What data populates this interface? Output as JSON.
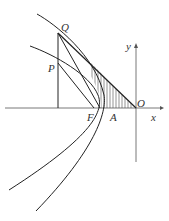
{
  "diagram": {
    "type": "geometry-figure",
    "labels": {
      "Q": "Q",
      "P": "P",
      "F": "F",
      "A": "A",
      "O": "O",
      "x": "x",
      "y": "y"
    },
    "colors": {
      "stroke": "#222222",
      "axis": "#555555",
      "hatch": "#666666",
      "text": "#333333"
    }
  }
}
